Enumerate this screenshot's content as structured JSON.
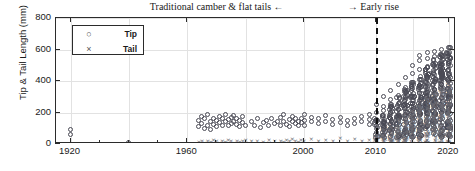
{
  "chart_data": {
    "type": "scatter",
    "title": "",
    "xlabel": "",
    "ylabel": "Tip & Tail Length (mm)",
    "xticks": [
      1920,
      1960,
      2000,
      2010,
      2020
    ],
    "yticks": [
      0,
      200,
      400,
      600,
      800
    ],
    "ylim": [
      0,
      800
    ],
    "xlim": [
      1915,
      2021
    ],
    "grid": true,
    "legend_position": "top-left",
    "axis_note": "x-axis compressed before 2000, expanded 2000-2020",
    "annotations": [
      {
        "name": "traditional-camber",
        "text": "Traditional camber & flat tails ←",
        "x": 1990
      },
      {
        "name": "early-rise",
        "text": "→ Early rise",
        "x": 2012
      }
    ],
    "divider": {
      "x": 2010,
      "style": "dashed"
    },
    "series": [
      {
        "name": "Tip",
        "marker": "circle",
        "color": "#4a4a55",
        "points": [
          [
            1920,
            60
          ],
          [
            1920,
            95
          ],
          [
            1940,
            10
          ],
          [
            1964,
            110
          ],
          [
            1964,
            150
          ],
          [
            1965,
            130
          ],
          [
            1965,
            175
          ],
          [
            1966,
            100
          ],
          [
            1966,
            160
          ],
          [
            1967,
            120
          ],
          [
            1967,
            185
          ],
          [
            1968,
            140
          ],
          [
            1968,
            95
          ],
          [
            1969,
            165
          ],
          [
            1969,
            125
          ],
          [
            1970,
            150
          ],
          [
            1970,
            110
          ],
          [
            1971,
            175
          ],
          [
            1971,
            135
          ],
          [
            1972,
            120
          ],
          [
            1972,
            160
          ],
          [
            1973,
            145
          ],
          [
            1973,
            190
          ],
          [
            1974,
            115
          ],
          [
            1974,
            155
          ],
          [
            1975,
            130
          ],
          [
            1975,
            170
          ],
          [
            1976,
            140
          ],
          [
            1976,
            180
          ],
          [
            1977,
            125
          ],
          [
            1977,
            165
          ],
          [
            1978,
            150
          ],
          [
            1978,
            110
          ],
          [
            1979,
            135
          ],
          [
            1979,
            175
          ],
          [
            1980,
            120
          ],
          [
            1982,
            145
          ],
          [
            1983,
            120
          ],
          [
            1984,
            160
          ],
          [
            1985,
            105
          ],
          [
            1986,
            135
          ],
          [
            1987,
            150
          ],
          [
            1988,
            115
          ],
          [
            1989,
            165
          ],
          [
            1990,
            130
          ],
          [
            1991,
            145
          ],
          [
            1992,
            170
          ],
          [
            1992,
            120
          ],
          [
            1993,
            140
          ],
          [
            1993,
            185
          ],
          [
            1994,
            125
          ],
          [
            1995,
            155
          ],
          [
            1995,
            110
          ],
          [
            1996,
            145
          ],
          [
            1996,
            175
          ],
          [
            1997,
            130
          ],
          [
            1997,
            160
          ],
          [
            1998,
            140
          ],
          [
            1998,
            115
          ],
          [
            1999,
            165
          ],
          [
            1999,
            135
          ],
          [
            2000,
            150
          ],
          [
            2000,
            185
          ],
          [
            2000,
            120
          ],
          [
            2001,
            140
          ],
          [
            2001,
            170
          ],
          [
            2002,
            130
          ],
          [
            2002,
            160
          ],
          [
            2003,
            145
          ],
          [
            2003,
            180
          ],
          [
            2004,
            125
          ],
          [
            2004,
            155
          ],
          [
            2005,
            135
          ],
          [
            2005,
            170
          ],
          [
            2006,
            150
          ],
          [
            2006,
            115
          ],
          [
            2007,
            160
          ],
          [
            2007,
            130
          ],
          [
            2008,
            145
          ],
          [
            2008,
            175
          ],
          [
            2009,
            155
          ],
          [
            2009,
            125
          ],
          [
            2009,
            190
          ],
          [
            2010,
            150
          ],
          [
            2010,
            200
          ],
          [
            2010,
            120
          ],
          [
            2010,
            250
          ],
          [
            2011,
            180
          ],
          [
            2011,
            240
          ],
          [
            2011,
            140
          ],
          [
            2011,
            300
          ],
          [
            2011,
            210
          ],
          [
            2012,
            200
          ],
          [
            2012,
            280
          ],
          [
            2012,
            160
          ],
          [
            2012,
            340
          ],
          [
            2012,
            230
          ],
          [
            2012,
            130
          ],
          [
            2013,
            220
          ],
          [
            2013,
            310
          ],
          [
            2013,
            175
          ],
          [
            2013,
            380
          ],
          [
            2013,
            260
          ],
          [
            2013,
            145
          ],
          [
            2014,
            240
          ],
          [
            2014,
            330
          ],
          [
            2014,
            190
          ],
          [
            2014,
            420
          ],
          [
            2014,
            285
          ],
          [
            2014,
            160
          ],
          [
            2014,
            360
          ],
          [
            2015,
            260
          ],
          [
            2015,
            355
          ],
          [
            2015,
            205
          ],
          [
            2015,
            450
          ],
          [
            2015,
            300
          ],
          [
            2015,
            170
          ],
          [
            2015,
            390
          ],
          [
            2015,
            500
          ],
          [
            2016,
            275
          ],
          [
            2016,
            370
          ],
          [
            2016,
            215
          ],
          [
            2016,
            470
          ],
          [
            2016,
            320
          ],
          [
            2016,
            180
          ],
          [
            2016,
            410
          ],
          [
            2016,
            530
          ],
          [
            2016,
            560
          ],
          [
            2017,
            285
          ],
          [
            2017,
            385
          ],
          [
            2017,
            225
          ],
          [
            2017,
            490
          ],
          [
            2017,
            335
          ],
          [
            2017,
            190
          ],
          [
            2017,
            430
          ],
          [
            2017,
            545
          ],
          [
            2017,
            580
          ],
          [
            2018,
            290
          ],
          [
            2018,
            395
          ],
          [
            2018,
            230
          ],
          [
            2018,
            500
          ],
          [
            2018,
            345
          ],
          [
            2018,
            195
          ],
          [
            2018,
            440
          ],
          [
            2018,
            555
          ],
          [
            2018,
            590
          ],
          [
            2019,
            295
          ],
          [
            2019,
            400
          ],
          [
            2019,
            235
          ],
          [
            2019,
            505
          ],
          [
            2019,
            350
          ],
          [
            2019,
            200
          ],
          [
            2019,
            445
          ],
          [
            2019,
            560
          ],
          [
            2019,
            600
          ],
          [
            2020,
            300
          ],
          [
            2020,
            405
          ],
          [
            2020,
            240
          ],
          [
            2020,
            510
          ],
          [
            2020,
            355
          ],
          [
            2020,
            205
          ],
          [
            2020,
            450
          ],
          [
            2020,
            565
          ],
          [
            2020,
            610
          ]
        ]
      },
      {
        "name": "Tail",
        "marker": "x",
        "color": "#6a6a72",
        "points": [
          [
            1964,
            15
          ],
          [
            1965,
            20
          ],
          [
            1966,
            10
          ],
          [
            1967,
            25
          ],
          [
            1968,
            15
          ],
          [
            1969,
            30
          ],
          [
            1970,
            20
          ],
          [
            1971,
            10
          ],
          [
            1972,
            25
          ],
          [
            1973,
            15
          ],
          [
            1974,
            30
          ],
          [
            1975,
            20
          ],
          [
            1976,
            10
          ],
          [
            1977,
            25
          ],
          [
            1978,
            15
          ],
          [
            1979,
            20
          ],
          [
            1980,
            30
          ],
          [
            1982,
            20
          ],
          [
            1984,
            25
          ],
          [
            1986,
            15
          ],
          [
            1988,
            30
          ],
          [
            1990,
            20
          ],
          [
            1992,
            25
          ],
          [
            1993,
            15
          ],
          [
            1994,
            30
          ],
          [
            1995,
            20
          ],
          [
            1996,
            35
          ],
          [
            1997,
            25
          ],
          [
            1998,
            15
          ],
          [
            1999,
            30
          ],
          [
            2000,
            25
          ],
          [
            2001,
            35
          ],
          [
            2002,
            20
          ],
          [
            2003,
            30
          ],
          [
            2004,
            25
          ],
          [
            2005,
            40
          ],
          [
            2006,
            20
          ],
          [
            2007,
            35
          ],
          [
            2008,
            25
          ],
          [
            2009,
            30
          ],
          [
            2010,
            30
          ],
          [
            2010,
            60
          ],
          [
            2011,
            45
          ],
          [
            2011,
            80
          ],
          [
            2011,
            25
          ],
          [
            2012,
            55
          ],
          [
            2012,
            100
          ],
          [
            2012,
            30
          ],
          [
            2012,
            130
          ],
          [
            2013,
            65
          ],
          [
            2013,
            120
          ],
          [
            2013,
            35
          ],
          [
            2013,
            160
          ],
          [
            2014,
            75
          ],
          [
            2014,
            140
          ],
          [
            2014,
            40
          ],
          [
            2014,
            190
          ],
          [
            2014,
            110
          ],
          [
            2015,
            85
          ],
          [
            2015,
            160
          ],
          [
            2015,
            45
          ],
          [
            2015,
            220
          ],
          [
            2015,
            125
          ],
          [
            2016,
            95
          ],
          [
            2016,
            180
          ],
          [
            2016,
            50
          ],
          [
            2016,
            250
          ],
          [
            2016,
            140
          ],
          [
            2016,
            290
          ],
          [
            2017,
            100
          ],
          [
            2017,
            195
          ],
          [
            2017,
            55
          ],
          [
            2017,
            270
          ],
          [
            2017,
            150
          ],
          [
            2017,
            320
          ],
          [
            2018,
            105
          ],
          [
            2018,
            205
          ],
          [
            2018,
            60
          ],
          [
            2018,
            285
          ],
          [
            2018,
            158
          ],
          [
            2018,
            340
          ],
          [
            2019,
            110
          ],
          [
            2019,
            210
          ],
          [
            2019,
            62
          ],
          [
            2019,
            295
          ],
          [
            2019,
            162
          ],
          [
            2019,
            355
          ],
          [
            2020,
            112
          ],
          [
            2020,
            215
          ],
          [
            2020,
            65
          ],
          [
            2020,
            300
          ],
          [
            2020,
            165
          ],
          [
            2020,
            365
          ]
        ]
      }
    ]
  },
  "legend": {
    "items": [
      {
        "label": "Tip",
        "marker": "○"
      },
      {
        "label": "Tail",
        "marker": "×"
      }
    ]
  }
}
